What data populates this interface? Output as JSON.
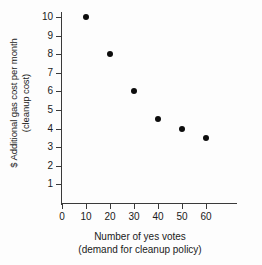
{
  "chart_data": {
    "type": "scatter",
    "title": "",
    "xlabel": "Number of yes votes",
    "xlabel_line2": "(demand for cleanup policy)",
    "ylabel": "$ Additional gas cost per month",
    "ylabel_line2": "(cleanup cost)",
    "x": [
      10,
      20,
      30,
      40,
      50,
      60
    ],
    "values": [
      10,
      8,
      6,
      4.5,
      4,
      3.5
    ],
    "points": [
      {
        "x": 10,
        "y": 10
      },
      {
        "x": 20,
        "y": 8
      },
      {
        "x": 30,
        "y": 6
      },
      {
        "x": 40,
        "y": 4.5
      },
      {
        "x": 50,
        "y": 4
      },
      {
        "x": 60,
        "y": 3.5
      }
    ],
    "xlim": [
      0,
      70
    ],
    "ylim": [
      0,
      10
    ],
    "xticks": [
      0,
      10,
      20,
      30,
      40,
      50,
      60
    ],
    "xtick_labels": [
      "0",
      "10",
      "20",
      "30",
      "40",
      "50",
      "60"
    ],
    "yticks": [
      1,
      2,
      3,
      4,
      5,
      6,
      7,
      8,
      9,
      10
    ],
    "ytick_labels": [
      "1",
      "2",
      "3",
      "4",
      "5",
      "6",
      "7",
      "8",
      "9",
      "10"
    ],
    "grid": false,
    "legend": null,
    "marker_color": "#0d0d0d",
    "axis_color": "#3a3a3a",
    "background_color": "#fdfdfd"
  }
}
